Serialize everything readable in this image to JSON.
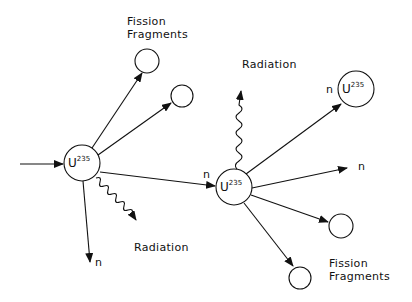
{
  "diagram": {
    "title": "",
    "nuclei": [
      {
        "symbol": "U",
        "mass": "235",
        "x": 82,
        "y": 163
      },
      {
        "symbol": "U",
        "mass": "235",
        "x": 234,
        "y": 187
      },
      {
        "symbol": "U",
        "mass": "235",
        "x": 356,
        "y": 89
      }
    ],
    "labels": {
      "fission_fragments_top_1": "Fission",
      "fission_fragments_top_2": "Fragments",
      "fission_fragments_bottom_1": "Fission",
      "fission_fragments_bottom_2": "Fragments",
      "radiation_left": "Radiation",
      "radiation_top": "Radiation",
      "n_down": "n",
      "n_middle": "n",
      "n_upper_right": "n",
      "n_right": "n"
    }
  }
}
